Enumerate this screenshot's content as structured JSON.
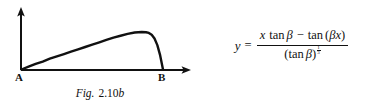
{
  "figure": {
    "caption_prefix": "Fig.",
    "caption_number": "2.10",
    "caption_suffix": "b",
    "axis_origin_label": "A",
    "axis_end_label": "B",
    "line_color": "#111111",
    "background_color": "#ffffff"
  },
  "chart_data": {
    "type": "line",
    "xlabel": "",
    "ylabel": "",
    "grid": false,
    "legend": null,
    "axes": {
      "x_axis_arrow": true,
      "y_axis_arrow": true,
      "x_tick_labels": [
        "A",
        "B"
      ],
      "y_tick_labels": [],
      "xlim": [
        0,
        1.18
      ],
      "ylim": [
        0,
        1.0
      ]
    },
    "annotations": [
      {
        "text": "A",
        "x": 0,
        "y": 0,
        "position": "below-left"
      },
      {
        "text": "B",
        "x": 1.0,
        "y": 0,
        "position": "below"
      }
    ],
    "series": [
      {
        "name": "y = (x tan B - tan(Bx)) / (tan B)^(1/3)",
        "x": [
          0.0,
          0.05,
          0.1,
          0.15,
          0.2,
          0.25,
          0.3,
          0.35,
          0.4,
          0.45,
          0.5,
          0.55,
          0.6,
          0.65,
          0.7,
          0.75,
          0.8,
          0.85,
          0.88,
          0.9,
          0.92,
          0.94,
          0.96,
          0.98,
          1.0
        ],
        "y": [
          0.0,
          0.06,
          0.12,
          0.17,
          0.23,
          0.28,
          0.33,
          0.38,
          0.43,
          0.48,
          0.53,
          0.58,
          0.63,
          0.68,
          0.72,
          0.76,
          0.79,
          0.8,
          0.795,
          0.78,
          0.74,
          0.66,
          0.52,
          0.3,
          0.0
        ]
      }
    ]
  },
  "equation": {
    "lhs": "y",
    "relation": "=",
    "numerator": {
      "term1_var": "x",
      "term1_func": "tan",
      "term1_arg": "β",
      "operator": "−",
      "term2_func": "tan",
      "term2_open": "(",
      "term2_arg1": "β",
      "term2_arg2": "x",
      "term2_close": ")"
    },
    "denominator": {
      "open": "(",
      "func": "tan",
      "arg": "β",
      "close": ")",
      "exponent_num": "1",
      "exponent_den": "3"
    },
    "plain_text": "y = (x tan β − tan(βx)) / (tan β)^(1/3)"
  }
}
